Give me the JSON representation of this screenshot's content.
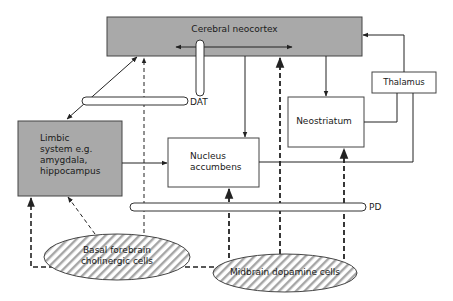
{
  "diagram": {
    "nodes": {
      "neocortex": {
        "label": "Cerebral neocortex",
        "fill": "#a9a9a9"
      },
      "limbic": {
        "label_lines": [
          "Limbic",
          "system e.g.",
          "amygdala,",
          "hippocampus"
        ],
        "fill": "#a9a9a9"
      },
      "nucleus_accumbens": {
        "label_lines": [
          "Nucleus",
          "accumbens"
        ],
        "fill": "#ffffff"
      },
      "neostriatum": {
        "label": "Neostriatum",
        "fill": "#ffffff"
      },
      "thalamus": {
        "label": "Thalamus",
        "fill": "#ffffff"
      },
      "basal_forebrain": {
        "label_lines": [
          "Basal forebrain",
          "cholinergic cells"
        ],
        "fill": "hatched"
      },
      "midbrain": {
        "label": "Midbrain dopamine cells",
        "fill": "hatched"
      }
    },
    "tubes": {
      "dat": {
        "label": "DAT"
      },
      "pd": {
        "label": "PD"
      }
    },
    "edges": [
      {
        "from": "neocortex",
        "to": "limbic",
        "style": "solid",
        "direction": "both"
      },
      {
        "from": "neocortex",
        "to": "neocortex",
        "style": "solid",
        "direction": "both",
        "note": "intracortical"
      },
      {
        "from": "neocortex",
        "to": "nucleus_accumbens",
        "style": "solid"
      },
      {
        "from": "neocortex",
        "to": "neostriatum",
        "style": "solid"
      },
      {
        "from": "thalamus",
        "to": "neocortex",
        "style": "solid"
      },
      {
        "from": "thalamus",
        "to": "neostriatum",
        "style": "solid"
      },
      {
        "from": "thalamus",
        "to": "nucleus_accumbens",
        "style": "solid"
      },
      {
        "from": "limbic",
        "to": "nucleus_accumbens",
        "style": "solid"
      },
      {
        "from": "basal_forebrain",
        "to": "neocortex",
        "style": "dashed"
      },
      {
        "from": "basal_forebrain",
        "to": "limbic",
        "style": "dashed"
      },
      {
        "from": "midbrain",
        "to": "neocortex",
        "style": "dashed-bold"
      },
      {
        "from": "midbrain",
        "to": "neostriatum",
        "style": "dashed-bold"
      },
      {
        "from": "midbrain",
        "to": "nucleus_accumbens",
        "style": "dashed-bold"
      },
      {
        "from": "midbrain",
        "to": "limbic",
        "style": "dashed-bold"
      }
    ],
    "colors": {
      "box_gray": "#a9a9a9",
      "line": "#333333",
      "background": "#ffffff"
    }
  }
}
